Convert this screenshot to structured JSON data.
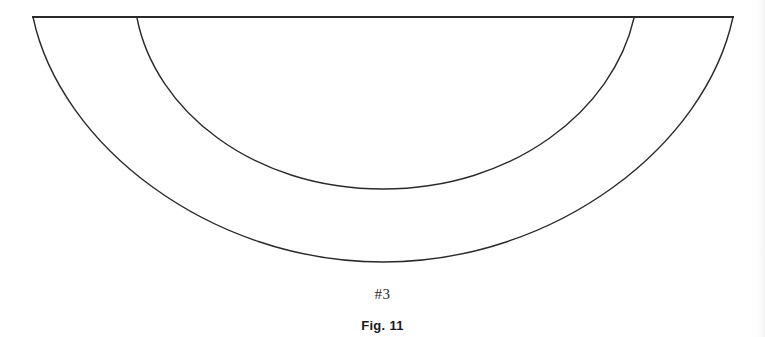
{
  "document": {
    "background_color": "#ffffff",
    "line_color": "#2a2a2a"
  },
  "figure": {
    "piece_label": "#3",
    "caption": "Fig. 11",
    "geometry": {
      "top_edge": {
        "name": "straight-top-edge",
        "x1": 33,
        "y1": 17,
        "x2": 733,
        "y2": 17
      },
      "outer_arc": {
        "name": "outer-hem-arc",
        "start_x": 33,
        "start_y": 17,
        "end_x": 733,
        "end_y": 17,
        "bottom_x": 383,
        "bottom_y": 262
      },
      "inner_arc": {
        "name": "inner-waist-arc",
        "start_x": 137,
        "start_y": 18,
        "end_x": 634,
        "end_y": 18,
        "bottom_x": 383,
        "bottom_y": 189
      },
      "left_side_seam": {
        "name": "left-side-seam",
        "x1": 33,
        "y1": 17,
        "x2": 137,
        "y2": 18
      },
      "right_side_seam": {
        "name": "right-side-seam",
        "x1": 634,
        "y1": 18,
        "x2": 733,
        "y2": 17
      }
    }
  }
}
